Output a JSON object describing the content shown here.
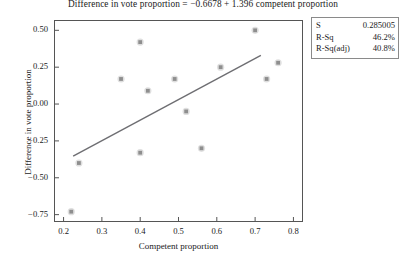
{
  "chart_data": {
    "type": "scatter",
    "title": "Difference in vote proportion = −0.6678 + 1.396 competent proportion",
    "xlabel": "Competent proportion",
    "ylabel": "Difference in vote proportion",
    "xlim": [
      0.175,
      0.825
    ],
    "ylim": [
      -0.8,
      0.57
    ],
    "grid": false,
    "legend": null,
    "x_ticks": [
      "0.2",
      "0.3",
      "0.4",
      "0.5",
      "0.6",
      "0.7",
      "0.8"
    ],
    "x_tick_values": [
      0.2,
      0.3,
      0.4,
      0.5,
      0.6,
      0.7,
      0.8
    ],
    "y_ticks": [
      "0.50",
      "0.25",
      "0.00",
      "−0.25",
      "−0.50",
      "−0.75"
    ],
    "y_tick_values": [
      0.5,
      0.25,
      0.0,
      -0.25,
      -0.5,
      -0.75
    ],
    "marker_color": "#9a9a9a",
    "line_color": "#6e6e72",
    "axis_color": "#555555",
    "x": [
      0.22,
      0.24,
      0.35,
      0.4,
      0.4,
      0.42,
      0.49,
      0.52,
      0.56,
      0.61,
      0.7,
      0.73,
      0.76
    ],
    "y": [
      -0.73,
      -0.4,
      0.17,
      0.42,
      -0.33,
      0.09,
      0.17,
      -0.05,
      -0.3,
      0.25,
      0.5,
      0.17,
      0.28
    ],
    "fit_line": {
      "intercept": -0.6678,
      "slope": 1.396,
      "x_start": 0.225,
      "x_end": 0.715
    }
  },
  "stats_box": {
    "rows": [
      {
        "label": "S",
        "value": "0.285005"
      },
      {
        "label": "R-Sq",
        "value": "46.2%"
      },
      {
        "label": "R-Sq(adj)",
        "value": "40.8%"
      }
    ]
  }
}
